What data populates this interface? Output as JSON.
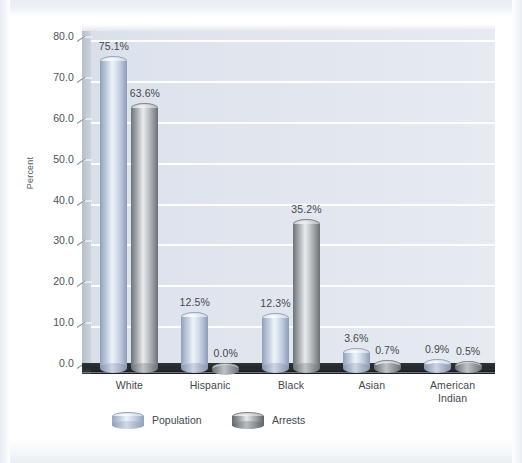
{
  "chart_data": {
    "type": "bar",
    "title": "",
    "xlabel": "",
    "ylabel": "Percent",
    "ylim": [
      0,
      80
    ],
    "ytick_step": 10,
    "grid": true,
    "legend_position": "bottom",
    "categories": [
      "White",
      "Hispanic",
      "Black",
      "Asian",
      "American Indian"
    ],
    "category_labels": [
      {
        "line1": "White",
        "line2": ""
      },
      {
        "line1": "Hispanic",
        "line2": ""
      },
      {
        "line1": "Black",
        "line2": ""
      },
      {
        "line1": "Asian",
        "line2": ""
      },
      {
        "line1": "American",
        "line2": "Indian"
      }
    ],
    "ytick_labels": [
      "80.0",
      "70.0",
      "60.0",
      "50.0",
      "40.0",
      "30.0",
      "20.0",
      "10.0",
      "0.0"
    ],
    "ytick_values": [
      80,
      70,
      60,
      50,
      40,
      30,
      20,
      10,
      0
    ],
    "series": [
      {
        "name": "Population",
        "color": "#b9c6da",
        "values": [
          75.1,
          12.5,
          12.3,
          3.6,
          0.9
        ],
        "labels": [
          "75.1%",
          "12.5%",
          "12.3%",
          "3.6%",
          "0.9%"
        ]
      },
      {
        "name": "Arrests",
        "color": "#9ba0a5",
        "values": [
          63.6,
          0.0,
          35.2,
          0.7,
          0.5
        ],
        "labels": [
          "63.6%",
          "0.0%",
          "35.2%",
          "0.7%",
          "0.5%"
        ]
      }
    ]
  },
  "legend": {
    "items": [
      {
        "label": "Population",
        "swatch": "population-cylinder-icon"
      },
      {
        "label": "Arrests",
        "swatch": "arrests-cylinder-icon"
      }
    ]
  }
}
